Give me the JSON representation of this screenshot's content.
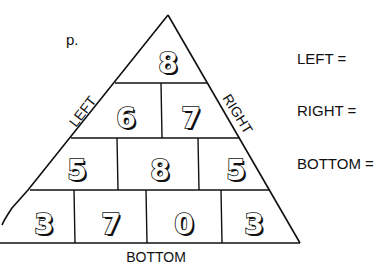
{
  "problem_label": "p.",
  "pyramid": {
    "rows": [
      [
        "8"
      ],
      [
        "6",
        "7"
      ],
      [
        "5",
        "8",
        "5"
      ],
      [
        "3",
        "7",
        "0",
        "3"
      ]
    ],
    "side_labels": {
      "left": "LEFT",
      "right": "RIGHT",
      "bottom": "BOTTOM"
    }
  },
  "answers": [
    {
      "label": "LEFT =",
      "value": ""
    },
    {
      "label": "RIGHT =",
      "value": ""
    },
    {
      "label": "BOTTOM =",
      "value": ""
    }
  ]
}
